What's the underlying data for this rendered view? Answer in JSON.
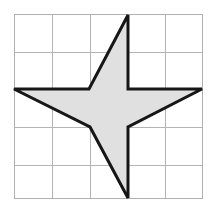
{
  "figure": {
    "background_color": "#ffffff",
    "watermark": {
      "text": "M",
      "color": "#ededed",
      "x": 84,
      "y": 110
    }
  },
  "grid": {
    "label": "square grid",
    "columns": 5,
    "rows": 5,
    "left": 14,
    "top": 14,
    "right": 202,
    "bottom": 198,
    "line_color": "#b4b4b4",
    "border_color": "#b0b0b0",
    "x_lines": [
      14,
      52,
      90,
      128,
      165,
      202
    ],
    "y_lines": [
      14,
      52,
      89,
      127,
      165,
      198
    ]
  },
  "shape": {
    "name": "four-pointed star",
    "fill_color": "#e0e0e0",
    "stroke_color": "#161616",
    "stroke_width": 3,
    "points_count": 4,
    "vertices": [
      {
        "name": "top-tip",
        "x": 128,
        "y": 15
      },
      {
        "name": "upper-right-notch",
        "x": 128,
        "y": 89
      },
      {
        "name": "right-tip",
        "x": 202,
        "y": 89
      },
      {
        "name": "lower-right-notch",
        "x": 128,
        "y": 127
      },
      {
        "name": "bottom-tip",
        "x": 128,
        "y": 198
      },
      {
        "name": "lower-left-notch",
        "x": 90,
        "y": 127
      },
      {
        "name": "left-tip",
        "x": 14,
        "y": 89
      },
      {
        "name": "upper-left-notch",
        "x": 89,
        "y": 89
      }
    ],
    "path": "128,15 128,89 202,89 128,127 128,198 90,127 14,89 89,89"
  }
}
